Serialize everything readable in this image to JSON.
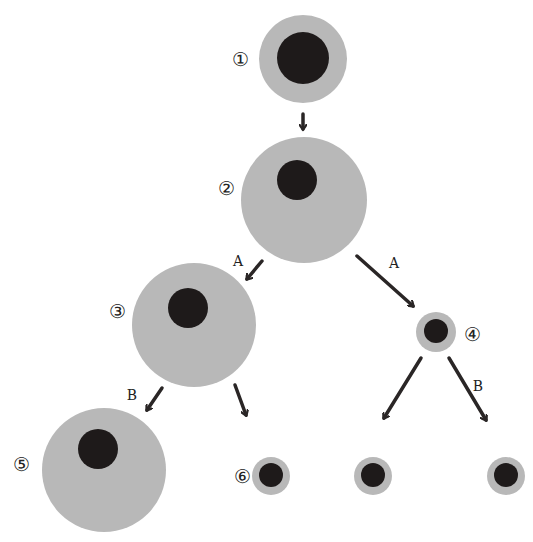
{
  "diagram": {
    "colors": {
      "cytoplasm": "#b8b8b8",
      "nucleus": "#1e1a1a",
      "arrow": "#2a2626",
      "label": "#222222",
      "background": "#ffffff"
    },
    "cells": [
      {
        "id": "1",
        "label": "①",
        "cx": 303,
        "cy": 59,
        "r": 44,
        "ncx": 303,
        "ncy": 58,
        "nr": 26,
        "lx": 240,
        "ly": 66
      },
      {
        "id": "2",
        "label": "②",
        "cx": 304,
        "cy": 200,
        "r": 63,
        "ncx": 297,
        "ncy": 180,
        "nr": 20,
        "lx": 226,
        "ly": 195
      },
      {
        "id": "3",
        "label": "③",
        "cx": 194,
        "cy": 325,
        "r": 62,
        "ncx": 188,
        "ncy": 308,
        "nr": 20,
        "lx": 117,
        "ly": 318
      },
      {
        "id": "4",
        "label": "④",
        "cx": 436,
        "cy": 332,
        "r": 20,
        "ncx": 436,
        "ncy": 331,
        "nr": 12,
        "lx": 472,
        "ly": 341
      },
      {
        "id": "5",
        "label": "⑤",
        "cx": 104,
        "cy": 470,
        "r": 62,
        "ncx": 98,
        "ncy": 449,
        "nr": 20,
        "lx": 21,
        "ly": 471
      },
      {
        "id": "6",
        "label": "⑥",
        "cx": 271,
        "cy": 476,
        "r": 19,
        "ncx": 271,
        "ncy": 475,
        "nr": 12,
        "lx": 242,
        "ly": 483
      },
      {
        "id": "7",
        "label": "",
        "cx": 373,
        "cy": 476,
        "r": 19,
        "ncx": 373,
        "ncy": 475,
        "nr": 12
      },
      {
        "id": "8",
        "label": "",
        "cx": 506,
        "cy": 476,
        "r": 19,
        "ncx": 506,
        "ncy": 475,
        "nr": 12
      }
    ],
    "arrows": [
      {
        "from": "1",
        "to": "2",
        "label": "",
        "x1": 303,
        "y1": 114,
        "x2": 303,
        "y2": 129
      },
      {
        "from": "2",
        "to": "3",
        "label": "A",
        "x1": 262,
        "y1": 261,
        "x2": 247,
        "y2": 279,
        "lx": 238,
        "ly": 266
      },
      {
        "from": "2",
        "to": "4",
        "label": "A",
        "x1": 357,
        "y1": 256,
        "x2": 413,
        "y2": 306,
        "lx": 394,
        "ly": 268
      },
      {
        "from": "3",
        "to": "5",
        "label": "B",
        "x1": 162,
        "y1": 388,
        "x2": 147,
        "y2": 410,
        "lx": 132,
        "ly": 400
      },
      {
        "from": "3",
        "to": "6",
        "label": "",
        "x1": 235,
        "y1": 385,
        "x2": 246,
        "y2": 415
      },
      {
        "from": "4",
        "to": "7",
        "label": "",
        "x1": 421,
        "y1": 358,
        "x2": 384,
        "y2": 418
      },
      {
        "from": "4",
        "to": "8",
        "label": "B",
        "x1": 449,
        "y1": 358,
        "x2": 486,
        "y2": 420,
        "lx": 478,
        "ly": 391
      }
    ]
  }
}
